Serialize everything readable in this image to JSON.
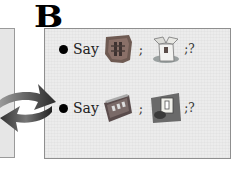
{
  "panel": {
    "label": "B"
  },
  "rows": [
    {
      "bullet": "•",
      "say_label": "Say",
      "image1": "carved-mask-picture",
      "separator": ";",
      "image2": "open-box-picture",
      "question": ";?"
    },
    {
      "bullet": "•",
      "say_label": "Say",
      "image1": "train-car-picture",
      "separator": ";",
      "image2": "light-switch-picture",
      "question": ";?"
    }
  ],
  "colors": {
    "panel_bg": "#ececec",
    "panel_border": "#8f8f8f",
    "arrow_gray": "#6a6a6a",
    "text": "#222222"
  }
}
